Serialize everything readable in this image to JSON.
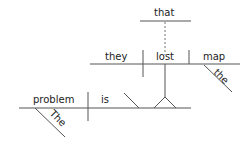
{
  "diagram": {
    "type": "sentence-diagram",
    "sentence": "The problem is that they lost the map",
    "main_clause": {
      "subject": "problem",
      "subject_modifier": "The",
      "verb": "is"
    },
    "noun_clause": {
      "connector": "that",
      "subject": "they",
      "verb": "lost",
      "object": "map",
      "object_modifier": "the"
    },
    "colors": {
      "line": "#555555",
      "text": "#222222",
      "background": "#ffffff"
    }
  }
}
